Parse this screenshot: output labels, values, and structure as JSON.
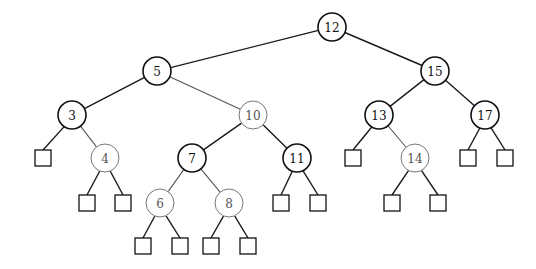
{
  "diagram": {
    "type": "red-black-tree",
    "legend": {
      "black_node_stroke": "#111111",
      "red_node_stroke": "#777777"
    },
    "nodes": [
      {
        "id": "n12",
        "label": "12",
        "color": "black",
        "x": 332,
        "y": 27
      },
      {
        "id": "n5",
        "label": "5",
        "color": "black",
        "x": 157,
        "y": 71
      },
      {
        "id": "n15",
        "label": "15",
        "color": "black",
        "x": 435,
        "y": 71
      },
      {
        "id": "n3",
        "label": "3",
        "color": "black",
        "x": 72,
        "y": 115
      },
      {
        "id": "n10",
        "label": "10",
        "color": "red",
        "x": 253,
        "y": 115
      },
      {
        "id": "n13",
        "label": "13",
        "color": "black",
        "x": 379,
        "y": 115
      },
      {
        "id": "n17",
        "label": "17",
        "color": "black",
        "x": 485,
        "y": 115
      },
      {
        "id": "n4",
        "label": "4",
        "color": "red",
        "x": 105,
        "y": 158
      },
      {
        "id": "n7",
        "label": "7",
        "color": "black",
        "x": 192,
        "y": 158
      },
      {
        "id": "n11",
        "label": "11",
        "color": "black",
        "x": 297,
        "y": 158
      },
      {
        "id": "n14",
        "label": "14",
        "color": "red",
        "x": 415,
        "y": 158
      },
      {
        "id": "n6",
        "label": "6",
        "color": "red",
        "x": 160,
        "y": 203
      },
      {
        "id": "n8",
        "label": "8",
        "color": "red",
        "x": 229,
        "y": 203
      }
    ],
    "leaves": [
      {
        "id": "l3L",
        "x": 43,
        "y": 158
      },
      {
        "id": "l4L",
        "x": 87,
        "y": 203
      },
      {
        "id": "l4R",
        "x": 123,
        "y": 203
      },
      {
        "id": "l6L",
        "x": 143,
        "y": 246
      },
      {
        "id": "l6R",
        "x": 180,
        "y": 246
      },
      {
        "id": "l8L",
        "x": 211,
        "y": 246
      },
      {
        "id": "l8R",
        "x": 248,
        "y": 246
      },
      {
        "id": "l11L",
        "x": 281,
        "y": 203
      },
      {
        "id": "l11R",
        "x": 318,
        "y": 203
      },
      {
        "id": "l13L",
        "x": 353,
        "y": 158
      },
      {
        "id": "l14L",
        "x": 392,
        "y": 203
      },
      {
        "id": "l14R",
        "x": 438,
        "y": 203
      },
      {
        "id": "l17L",
        "x": 468,
        "y": 158
      },
      {
        "id": "l17R",
        "x": 505,
        "y": 158
      }
    ],
    "edges": [
      [
        "n12",
        "n5"
      ],
      [
        "n12",
        "n15"
      ],
      [
        "n5",
        "n3"
      ],
      [
        "n5",
        "n10"
      ],
      [
        "n15",
        "n13"
      ],
      [
        "n15",
        "n17"
      ],
      [
        "n3",
        "l3L"
      ],
      [
        "n3",
        "n4"
      ],
      [
        "n4",
        "l4L"
      ],
      [
        "n4",
        "l4R"
      ],
      [
        "n10",
        "n7"
      ],
      [
        "n10",
        "n11"
      ],
      [
        "n7",
        "n6"
      ],
      [
        "n7",
        "n8"
      ],
      [
        "n6",
        "l6L"
      ],
      [
        "n6",
        "l6R"
      ],
      [
        "n8",
        "l8L"
      ],
      [
        "n8",
        "l8R"
      ],
      [
        "n11",
        "l11L"
      ],
      [
        "n11",
        "l11R"
      ],
      [
        "n13",
        "l13L"
      ],
      [
        "n13",
        "n14"
      ],
      [
        "n14",
        "l14L"
      ],
      [
        "n14",
        "l14R"
      ],
      [
        "n17",
        "l17L"
      ],
      [
        "n17",
        "l17R"
      ]
    ]
  }
}
